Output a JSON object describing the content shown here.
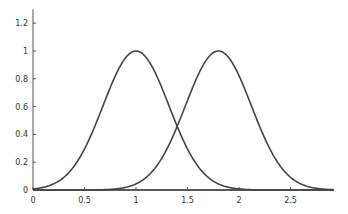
{
  "chart_data": {
    "type": "line",
    "title": "",
    "xlabel": "",
    "ylabel": "",
    "xlim": [
      0,
      2.92
    ],
    "ylim": [
      0,
      1.3
    ],
    "grid": false,
    "legend": null,
    "x_ticks": [
      "0",
      "0.5",
      "1",
      "1.5",
      "2",
      "2.5"
    ],
    "y_ticks": [
      "0",
      "0.2",
      "0.4",
      "0.6",
      "0.8",
      "1",
      "1.2"
    ],
    "series": [
      {
        "name": "gaussian-1",
        "mu": 1.0,
        "sigma": 0.32,
        "peak": 1.0,
        "x": [
          0,
          0.25,
          0.5,
          0.75,
          1.0,
          1.25,
          1.5,
          1.75,
          2.0,
          2.25,
          2.5,
          2.75,
          2.92
        ],
        "values": [
          0.01,
          0.06,
          0.3,
          0.74,
          1.0,
          0.74,
          0.3,
          0.06,
          0.01,
          0.0,
          0.0,
          0.0,
          0.0
        ]
      },
      {
        "name": "gaussian-2",
        "mu": 1.8,
        "sigma": 0.32,
        "peak": 1.0,
        "x": [
          0,
          0.25,
          0.5,
          0.75,
          1.0,
          1.25,
          1.5,
          1.75,
          2.0,
          2.25,
          2.5,
          2.75,
          2.92
        ],
        "values": [
          0.0,
          0.0,
          0.0,
          0.0,
          0.04,
          0.23,
          0.64,
          0.99,
          0.82,
          0.37,
          0.09,
          0.01,
          0.0
        ]
      }
    ],
    "colors": {
      "line": "#444444",
      "axis": "#555555"
    }
  }
}
